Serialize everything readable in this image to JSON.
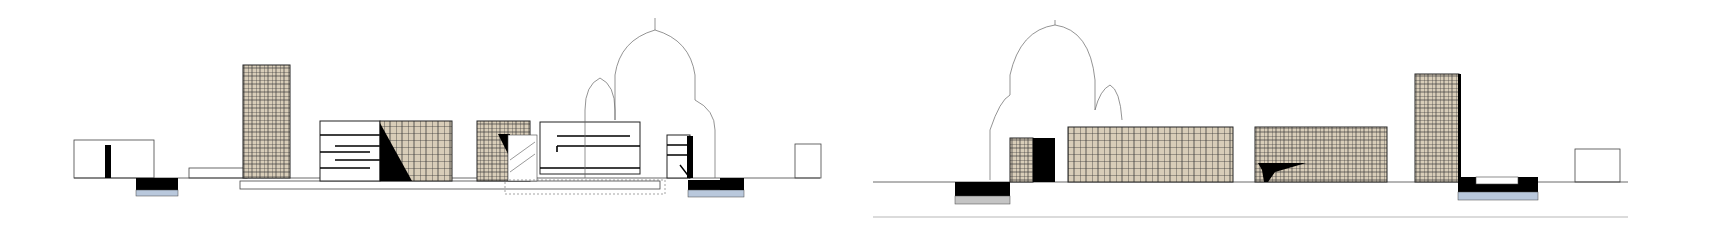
{
  "drawing": {
    "type": "architectural elevation",
    "colors": {
      "background": "#ffffff",
      "line": "#222222",
      "thin_line": "#555555",
      "facade_fill": "#d8cdb8",
      "solid": "#000000",
      "water": "#b9c8dc"
    },
    "elevations": [
      {
        "name": "left-elevation",
        "ground_y": 180
      },
      {
        "name": "right-elevation",
        "ground_y": 185
      }
    ],
    "labels": [
      "",
      "",
      "",
      ""
    ]
  }
}
